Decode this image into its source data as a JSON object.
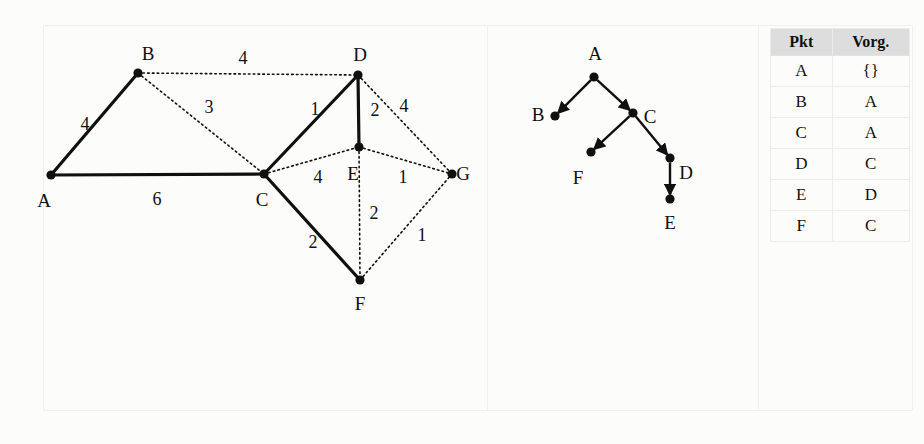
{
  "page": {
    "background_color": "#fcfcfb",
    "ink_color": "#101010",
    "guide_color": "#f0f0ee"
  },
  "weighted_graph": {
    "name": "undirected-weighted-graph",
    "nodes": [
      {
        "id": "A",
        "label": "A",
        "x": 51,
        "y": 175,
        "label_x": 44,
        "label_y": 200
      },
      {
        "id": "B",
        "label": "B",
        "x": 138,
        "y": 73,
        "label_x": 148,
        "label_y": 53
      },
      {
        "id": "C",
        "label": "C",
        "x": 264,
        "y": 174,
        "label_x": 262,
        "label_y": 199
      },
      {
        "id": "D",
        "label": "D",
        "x": 358,
        "y": 75,
        "label_x": 360,
        "label_y": 54
      },
      {
        "id": "E",
        "label": "E",
        "x": 359,
        "y": 147,
        "label_x": 353,
        "label_y": 173
      },
      {
        "id": "F",
        "label": "F",
        "x": 360,
        "y": 280,
        "label_x": 360,
        "label_y": 303
      },
      {
        "id": "G",
        "label": "G",
        "x": 452,
        "y": 174,
        "label_x": 463,
        "label_y": 173
      }
    ],
    "edges": [
      {
        "from": "A",
        "to": "B",
        "weight": "4",
        "style": "solid",
        "label_x": 85,
        "label_y": 124
      },
      {
        "from": "A",
        "to": "C",
        "weight": "6",
        "style": "solid",
        "label_x": 157,
        "label_y": 199
      },
      {
        "from": "B",
        "to": "D",
        "weight": "4",
        "style": "dotted",
        "label_x": 243,
        "label_y": 58
      },
      {
        "from": "B",
        "to": "C",
        "weight": "3",
        "style": "dotted",
        "label_x": 209,
        "label_y": 107
      },
      {
        "from": "C",
        "to": "D",
        "weight": "1",
        "style": "solid",
        "label_x": 315,
        "label_y": 109
      },
      {
        "from": "C",
        "to": "E",
        "weight": "4",
        "style": "dotted",
        "label_x": 318,
        "label_y": 177
      },
      {
        "from": "C",
        "to": "F",
        "weight": "2",
        "style": "solid",
        "label_x": 313,
        "label_y": 242
      },
      {
        "from": "D",
        "to": "E",
        "weight": "2",
        "style": "solid",
        "label_x": 375,
        "label_y": 110
      },
      {
        "from": "D",
        "to": "G",
        "weight": "4",
        "style": "dotted",
        "label_x": 404,
        "label_y": 106
      },
      {
        "from": "E",
        "to": "G",
        "weight": "1",
        "style": "dotted",
        "label_x": 403,
        "label_y": 177
      },
      {
        "from": "E",
        "to": "F",
        "weight": "2",
        "style": "dotted",
        "label_x": 374,
        "label_y": 213
      },
      {
        "from": "F",
        "to": "G",
        "weight": "1",
        "style": "dotted",
        "label_x": 422,
        "label_y": 235
      }
    ]
  },
  "tree_graph": {
    "name": "directed-spanning-tree",
    "nodes": [
      {
        "id": "A",
        "label": "A",
        "x": 594,
        "y": 77,
        "label_x": 595,
        "label_y": 53
      },
      {
        "id": "B",
        "label": "B",
        "x": 555,
        "y": 116,
        "label_x": 538,
        "label_y": 114
      },
      {
        "id": "C",
        "label": "C",
        "x": 633,
        "y": 113,
        "label_x": 650,
        "label_y": 116
      },
      {
        "id": "F",
        "label": "F",
        "x": 591,
        "y": 152,
        "label_x": 578,
        "label_y": 177
      },
      {
        "id": "D",
        "label": "D",
        "x": 670,
        "y": 158,
        "label_x": 686,
        "label_y": 172
      },
      {
        "id": "E",
        "label": "E",
        "x": 670,
        "y": 199,
        "label_x": 670,
        "label_y": 222
      }
    ],
    "edges": [
      {
        "from": "A",
        "to": "B"
      },
      {
        "from": "A",
        "to": "C"
      },
      {
        "from": "C",
        "to": "F"
      },
      {
        "from": "C",
        "to": "D"
      },
      {
        "from": "D",
        "to": "E"
      }
    ]
  },
  "table": {
    "name": "predecessor-table",
    "headers": [
      "Pkt",
      "Vorg."
    ],
    "rows": [
      [
        "A",
        "{}"
      ],
      [
        "B",
        "A"
      ],
      [
        "C",
        "A"
      ],
      [
        "D",
        "C"
      ],
      [
        "E",
        "D"
      ],
      [
        "F",
        "C"
      ]
    ]
  }
}
